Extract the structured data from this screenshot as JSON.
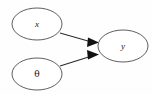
{
  "diagram": {
    "type": "directed-acyclic-graph",
    "nodes": [
      {
        "id": "x",
        "label": "x",
        "label_style": "italic-serif",
        "cx": 37,
        "cy": 24,
        "rx": 25,
        "ry": 16
      },
      {
        "id": "theta",
        "label": "θ",
        "label_style": "greek-serif",
        "cx": 37,
        "cy": 74,
        "rx": 25,
        "ry": 16
      },
      {
        "id": "y",
        "label": "y",
        "label_style": "italic-serif",
        "cx": 123,
        "cy": 46,
        "rx": 25,
        "ry": 16
      }
    ],
    "edges": [
      {
        "id": "edge-x-to-y",
        "from": "x",
        "to": "y",
        "path": "M 60,33 L 95,43",
        "arrowhead": "M 88,37.5 L 99,42.5 L 87,47 Z",
        "directed": true
      },
      {
        "id": "edge-theta-to-y",
        "from": "theta",
        "to": "y",
        "path": "M 60,66 L 95,55",
        "arrowhead": "M 87,50 L 99,54.5 L 88,59.5 Z",
        "directed": true
      }
    ],
    "watermark": {
      "text": "",
      "x": 63,
      "y": 73,
      "visible": true
    }
  },
  "colors": {
    "background": "#fefefe",
    "node_stroke": "#5f5f5f",
    "node_fill": "#ffffff",
    "edge_stroke": "#2a2a2a",
    "arrowhead_fill": "#111111",
    "label_text": "#1a1a1a",
    "watermark": "#f0f0f0"
  }
}
